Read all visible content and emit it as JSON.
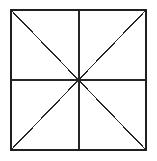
{
  "figure": {
    "title": "Square divided into eight triangles by midlines and diagonals",
    "type": "line-drawing",
    "canvas": {
      "width": 157,
      "height": 161,
      "background_color": "#ffffff"
    },
    "colors": {
      "stroke": "#262626",
      "border_stroke": "#1f1f1f",
      "fill": "#ffffff"
    },
    "square": {
      "name": "outer-square",
      "left": 10,
      "top": 9,
      "right": 147,
      "bottom": 151,
      "width": 137,
      "height": 142,
      "border_width": 2,
      "fill": "none"
    },
    "center_point": {
      "x": 79,
      "y": 80,
      "label": "center"
    },
    "interior_lines": [
      {
        "name": "horizontal-midline",
        "orientation": "horizontal",
        "x1": 10,
        "y1": 80,
        "x2": 147,
        "y2": 80,
        "stroke_width": 1.2
      },
      {
        "name": "vertical-midline",
        "orientation": "vertical",
        "x1": 79,
        "y1": 9,
        "x2": 79,
        "y2": 151,
        "stroke_width": 1.2
      },
      {
        "name": "diagonal-tl-br",
        "orientation": "diagonal",
        "x1": 10,
        "y1": 9,
        "x2": 147,
        "y2": 151,
        "stroke_width": 1.2
      },
      {
        "name": "diagonal-tr-bl",
        "orientation": "diagonal",
        "x1": 147,
        "y1": 9,
        "x2": 10,
        "y2": 151,
        "stroke_width": 1.2
      }
    ],
    "regions": {
      "count": 8,
      "shape": "triangle",
      "description": "Eight congruent triangles meeting at the center"
    }
  }
}
